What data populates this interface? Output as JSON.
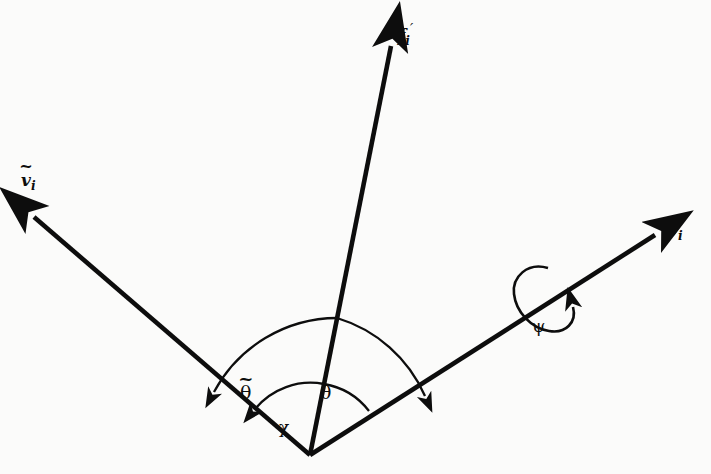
{
  "figure": {
    "type": "vector-diagram",
    "title": "",
    "background_color": "#fbfbfa",
    "stroke_color": "#0d0d0d",
    "width": 711,
    "height": 474,
    "origin": {
      "x": 310,
      "y": 455,
      "name": "vertex"
    }
  },
  "labels": {
    "f_prime": {
      "base": "f",
      "subscript": "i",
      "prime": "′"
    },
    "v_tilde": {
      "base": "v",
      "subscript": "i",
      "accent": "~"
    },
    "v": {
      "base": "v",
      "subscript": "i"
    },
    "psi": "ψ",
    "theta_tilde": {
      "base": "θ",
      "accent": "~"
    },
    "theta": "θ",
    "chi": "χ"
  },
  "vectors": [
    {
      "name": "v-tilde-vector",
      "label": "v_tilde",
      "from": {
        "x": 310,
        "y": 455
      },
      "to": {
        "x": 29,
        "y": 213
      },
      "arrowhead": "to"
    },
    {
      "name": "f-prime-vector",
      "label": "f_prime",
      "from": {
        "x": 310,
        "y": 455
      },
      "to": {
        "x": 393,
        "y": 36
      },
      "arrowhead": "to"
    },
    {
      "name": "v-vector",
      "label": "v",
      "from": {
        "x": 310,
        "y": 455
      },
      "to": {
        "x": 661,
        "y": 231
      },
      "arrowhead": "to"
    }
  ],
  "angles": [
    {
      "name": "theta-tilde-arc",
      "label": "theta_tilde",
      "between": [
        "f-prime-vector",
        "v-tilde-vector"
      ],
      "radius": 140,
      "direction": "counterclockwise"
    },
    {
      "name": "theta-arc",
      "label": "theta",
      "between": [
        "f-prime-vector",
        "v-vector"
      ],
      "radius": 140,
      "direction": "clockwise"
    },
    {
      "name": "chi-arc",
      "label": "chi",
      "between": [
        "f-prime-vector",
        "v-tilde-vector"
      ],
      "radius": 72,
      "direction": "counterclockwise"
    },
    {
      "name": "inner-arc",
      "label": "",
      "between": [
        "v-vector",
        "f-prime-vector"
      ],
      "radius": 72,
      "direction": "none"
    }
  ],
  "rotation": {
    "name": "psi-rotation",
    "label": "psi",
    "about": "v-vector",
    "center": {
      "x": 540,
      "y": 297
    },
    "direction": "counterclockwise"
  }
}
